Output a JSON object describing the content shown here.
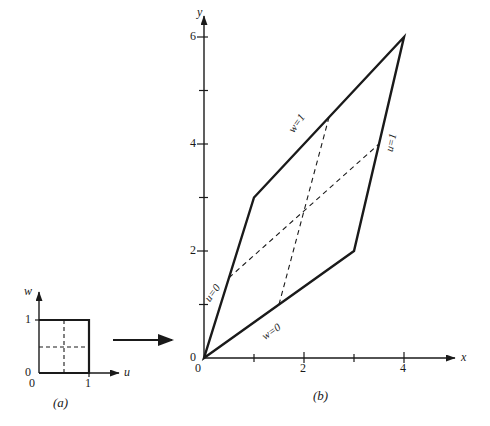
{
  "figure": {
    "panel_a": {
      "caption": "(a)",
      "axis_x_label": "u",
      "axis_y_label": "w",
      "origin_label": "0",
      "x_ticks": [
        {
          "value": 0,
          "label": "0"
        },
        {
          "value": 1,
          "label": "1"
        }
      ],
      "y_ticks": [
        {
          "value": 0,
          "label": "0"
        },
        {
          "value": 1,
          "label": "1"
        }
      ],
      "square_vertices": [
        {
          "u": 0,
          "w": 0
        },
        {
          "u": 1,
          "w": 0
        },
        {
          "u": 1,
          "w": 1
        },
        {
          "u": 0,
          "w": 1
        }
      ],
      "dashed_lines": [
        {
          "name": "u-constant",
          "from": {
            "u": 0.5,
            "w": 0
          },
          "to": {
            "u": 0.5,
            "w": 1
          }
        },
        {
          "name": "w-constant",
          "from": {
            "u": 0,
            "w": 0.5
          },
          "to": {
            "u": 1,
            "w": 0.5
          }
        }
      ]
    },
    "arrow": {
      "name": "mapping-arrow",
      "direction": "right"
    },
    "panel_b": {
      "caption": "(b)",
      "axis_x_label": "x",
      "axis_y_label": "y",
      "origin_label": "0",
      "x_ticks": [
        {
          "value": 0,
          "label": "0"
        },
        {
          "value": 1,
          "label": ""
        },
        {
          "value": 2,
          "label": "2"
        },
        {
          "value": 3,
          "label": ""
        },
        {
          "value": 4,
          "label": "4"
        }
      ],
      "y_ticks": [
        {
          "value": 0,
          "label": "0"
        },
        {
          "value": 1,
          "label": ""
        },
        {
          "value": 2,
          "label": "2"
        },
        {
          "value": 3,
          "label": ""
        },
        {
          "value": 4,
          "label": "4"
        },
        {
          "value": 5,
          "label": ""
        },
        {
          "value": 6,
          "label": "6"
        }
      ],
      "quad_vertices": [
        {
          "x": 0,
          "y": 0
        },
        {
          "x": 3,
          "y": 2
        },
        {
          "x": 4,
          "y": 6
        },
        {
          "x": 1,
          "y": 3
        }
      ],
      "edge_labels": [
        {
          "name": "u-equals-zero",
          "text": "u=0"
        },
        {
          "name": "w-equals-zero",
          "text": "w=0"
        },
        {
          "name": "u-equals-one",
          "text": "u=1"
        },
        {
          "name": "w-equals-one",
          "text": "w=1"
        }
      ],
      "dashed_lines": [
        {
          "name": "u-midline",
          "from": {
            "x": 0.5,
            "y": 1.5
          },
          "to": {
            "x": 3.5,
            "y": 4.0
          }
        },
        {
          "name": "w-midline",
          "from": {
            "x": 1.5,
            "y": 1.0
          },
          "to": {
            "x": 2.5,
            "y": 4.5
          }
        }
      ]
    },
    "colors": {
      "ink": "#1a1a1a",
      "background": "#ffffff"
    }
  }
}
